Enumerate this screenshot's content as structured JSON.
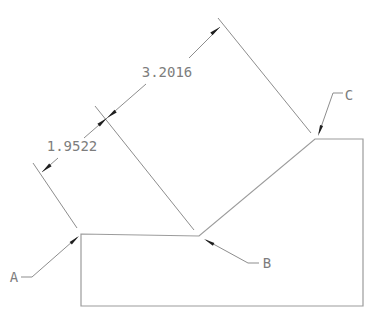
{
  "drawing": {
    "type": "cad-dimension-drawing",
    "dimensions": [
      {
        "value": "1.9522"
      },
      {
        "value": "3.2016"
      }
    ],
    "vertex_labels": [
      {
        "text": "A"
      },
      {
        "text": "B"
      },
      {
        "text": "C"
      }
    ],
    "colors": {
      "background": "#ffffff",
      "outline": "#9c9c9c",
      "dimension": "#8d8d8d",
      "text": "#7d7d7d",
      "arrow": "#1f1f1f"
    }
  }
}
